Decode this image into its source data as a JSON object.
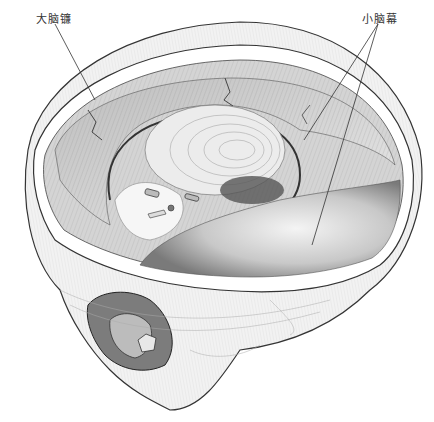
{
  "figure": {
    "labels": [
      {
        "id": "falx",
        "text": "大脑镰",
        "x": 20,
        "y": 10
      },
      {
        "id": "tentorium",
        "text": "小脑幕",
        "x": 366,
        "y": 10
      }
    ],
    "colors": {
      "ink": "#2a2a2a",
      "shade": "#8a8a8a",
      "light": "#dcdcdc",
      "paper": "#ffffff"
    }
  }
}
